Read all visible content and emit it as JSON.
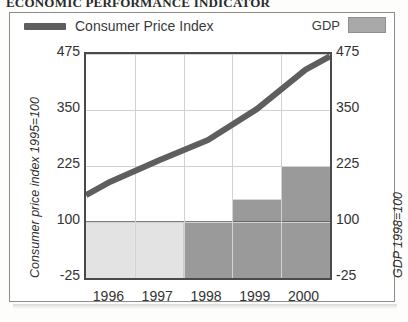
{
  "headline": "ECONOMIC PERFORMANCE INDICATOR",
  "legend": {
    "cpi_label": "Consumer Price Index",
    "gdp_label": "GDP",
    "cpi_color": "#5e5e5e",
    "gdp_color": "#a9a9a9"
  },
  "axes": {
    "left_title": "Consumer price index 1995=100",
    "right_title": "GDP 1998=100",
    "left_ticks": [
      "475",
      "350",
      "225",
      "100",
      "-25"
    ],
    "right_ticks": [
      "475",
      "350",
      "225",
      "100",
      "-25"
    ],
    "x_ticks": [
      "1996",
      "1997",
      "1998",
      "1999",
      "2000"
    ]
  },
  "chart_data": {
    "type": "line",
    "title": "ECONOMIC PERFORMANCE INDICATOR",
    "xlabel": "",
    "ylabel": "Consumer price index 1995=100",
    "y2label": "GDP 1998=100",
    "ylim": [
      -25,
      475
    ],
    "y2lim": [
      -25,
      475
    ],
    "yticks": [
      -25,
      100,
      225,
      350,
      475
    ],
    "y2ticks": [
      -25,
      100,
      225,
      350,
      475
    ],
    "categories": [
      "1996",
      "1997",
      "1998",
      "1999",
      "2000"
    ],
    "grid": true,
    "legend_position": "top",
    "series": [
      {
        "name": "Consumer Price Index",
        "type": "line",
        "axis": "left",
        "color": "#5e5e5e",
        "x": [
          1995.5,
          1996.0,
          1997.0,
          1998.0,
          1999.0,
          2000.0,
          2000.5
        ],
        "values": [
          160,
          190,
          238,
          283,
          352,
          440,
          470
        ]
      },
      {
        "name": "GDP",
        "type": "bar",
        "axis": "right",
        "color": "#a9a9a9",
        "categories": [
          "1996",
          "1997",
          "1998",
          "1999",
          "2000"
        ],
        "values": [
          100,
          100,
          100,
          150,
          225
        ]
      }
    ]
  }
}
